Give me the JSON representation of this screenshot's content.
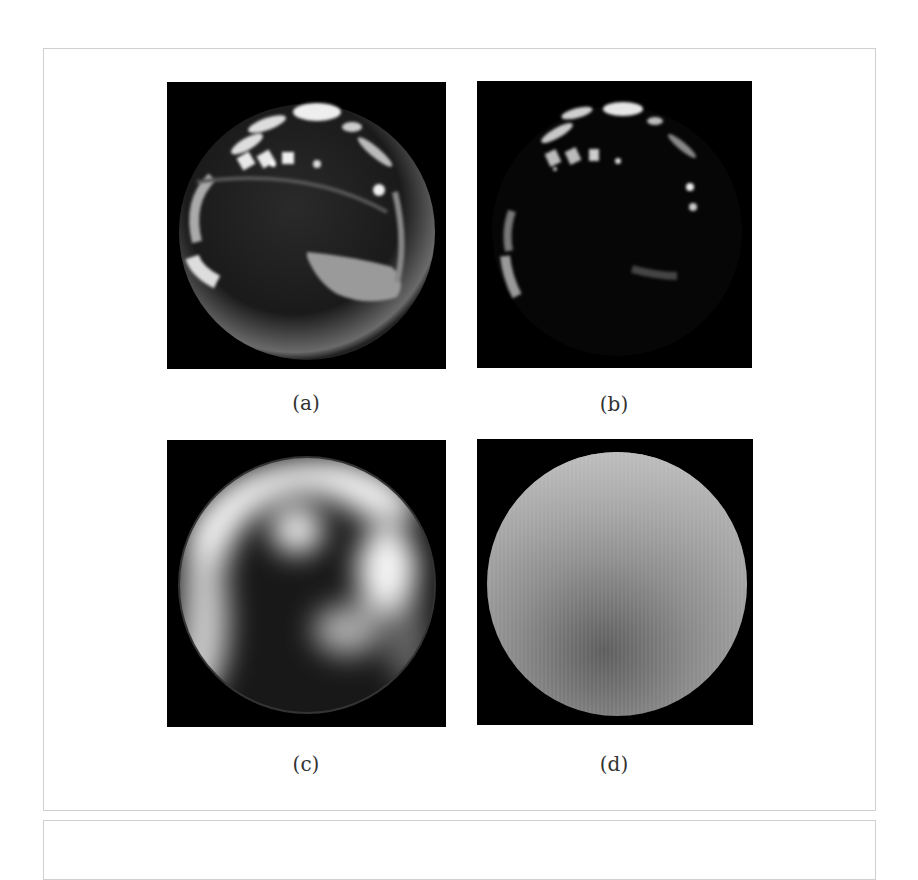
{
  "figure": {
    "panels": [
      {
        "id": "a",
        "caption": "(a)",
        "description": "mirror-ball environment map, full exposure"
      },
      {
        "id": "b",
        "caption": "(b)",
        "description": "mirror-ball environment map, low exposure"
      },
      {
        "id": "c",
        "caption": "(c)",
        "description": "blurred low-frequency lighting sphere"
      },
      {
        "id": "d",
        "caption": "(d)",
        "description": "diffuse irradiance sphere"
      }
    ]
  },
  "colors": {
    "background": "#ffffff",
    "frame_border": "#cfcfcf",
    "panel_background": "#000000",
    "caption_text": "#333333"
  }
}
